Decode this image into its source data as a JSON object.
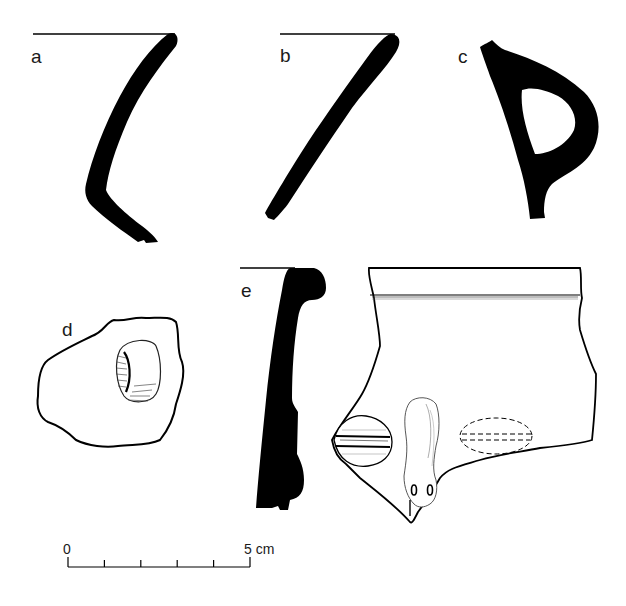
{
  "figure": {
    "type": "archaeological pottery sherd drawings",
    "panels": [
      {
        "id": "a",
        "label": "a",
        "kind": "rim profile section"
      },
      {
        "id": "b",
        "label": "b",
        "kind": "rim profile section"
      },
      {
        "id": "c",
        "label": "c",
        "kind": "handle cross-section"
      },
      {
        "id": "d",
        "label": "d",
        "kind": "sherd with applied boss"
      },
      {
        "id": "e",
        "label": "e",
        "kind": "rim profile section with exterior view"
      }
    ],
    "scale_bar": {
      "start_label": "0",
      "end_label": "5 cm",
      "divisions": 5
    },
    "colors": {
      "ink": "#000000",
      "background": "#ffffff"
    }
  }
}
